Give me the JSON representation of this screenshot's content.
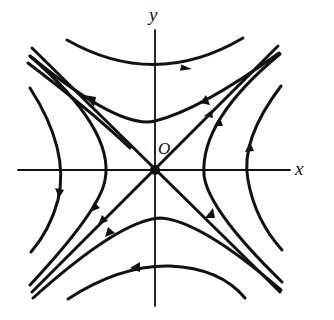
{
  "diagram": {
    "type": "phase-portrait-saddle",
    "labels": {
      "x_axis": "x",
      "y_axis": "y",
      "origin": "O"
    },
    "colors": {
      "stroke": "#111111",
      "background": "#ffffff"
    }
  }
}
